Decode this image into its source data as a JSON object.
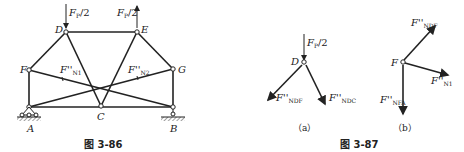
{
  "figure_86": {
    "caption": "图 3-86",
    "nodes": {
      "A": "A",
      "B": "B",
      "C": "C",
      "D": "D",
      "E": "E",
      "F": "F",
      "G": "G"
    },
    "loads": {
      "D": "F",
      "D_sub": "P",
      "D_rest": "/2",
      "E": "F",
      "E_sub": "P",
      "E_rest": "/2"
    },
    "forces": {
      "n1": "F''",
      "n1_sub": "N1",
      "n2": "F''",
      "n2_sub": "N2"
    }
  },
  "figure_87": {
    "caption": "图 3-87",
    "a": {
      "label": "（a）",
      "node": "D",
      "load": "F",
      "load_sub": "P",
      "load_rest": "/2",
      "f1": "F''",
      "f1_sub": "NDF",
      "f2": "F''",
      "f2_sub": "NDC"
    },
    "b": {
      "label": "（b）",
      "node": "F",
      "f1": "F''",
      "f1_sub": "NDF",
      "f2": "F''",
      "f2_sub": "N1",
      "f3": "F''",
      "f3_sub": "NFA"
    }
  }
}
